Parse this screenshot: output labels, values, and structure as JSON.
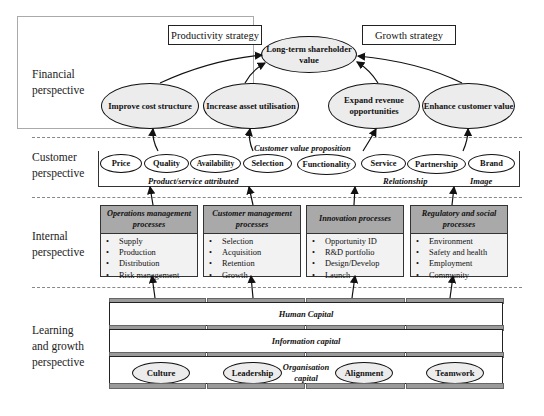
{
  "perspectives": {
    "financial": "Financial perspective",
    "customer": "Customer perspective",
    "internal": "Internal perspective",
    "learning": "Learning and growth perspective"
  },
  "financial": {
    "productivity_strategy": "Productivity strategy",
    "growth_strategy": "Growth strategy",
    "top_goal": "Long-term shareholder value",
    "goals": [
      "Improve cost structure",
      "Increase asset utilisation",
      "Expand revenue opportunities",
      "Enhance customer value"
    ]
  },
  "customer": {
    "title": "Customer value proposition",
    "attributes": [
      "Price",
      "Quality",
      "Availability",
      "Selection",
      "Functionality",
      "Service",
      "Partnership",
      "Brand"
    ],
    "group_labels": [
      "Product/service attributed",
      "Relationship",
      "Image"
    ]
  },
  "internal": {
    "processes": [
      {
        "title": "Operations management processes",
        "items": [
          "Supply",
          "Production",
          "Distribution",
          "Risk management"
        ]
      },
      {
        "title": "Customer management processes",
        "items": [
          "Selection",
          "Acquisition",
          "Retention",
          "Growth"
        ]
      },
      {
        "title": "Innovation processes",
        "items": [
          "Opportunity ID",
          "R&D portfolio",
          "Design/Develop",
          "Launch"
        ]
      },
      {
        "title": "Regulatory and social processes",
        "items": [
          "Environment",
          "Safety and health",
          "Employment",
          "Community"
        ]
      }
    ]
  },
  "learning": {
    "human_capital": "Human Capital",
    "information_capital": "Information capital",
    "organisation_capital": "Organisation capital",
    "org_items": [
      "Culture",
      "Leadership",
      "Alignment",
      "Teamwork"
    ]
  },
  "colors": {
    "ellipse_fill": "#ececec",
    "process_header": "#a9a9a9",
    "process_body": "#f2f2f2",
    "bar": "#9a9a9a"
  }
}
